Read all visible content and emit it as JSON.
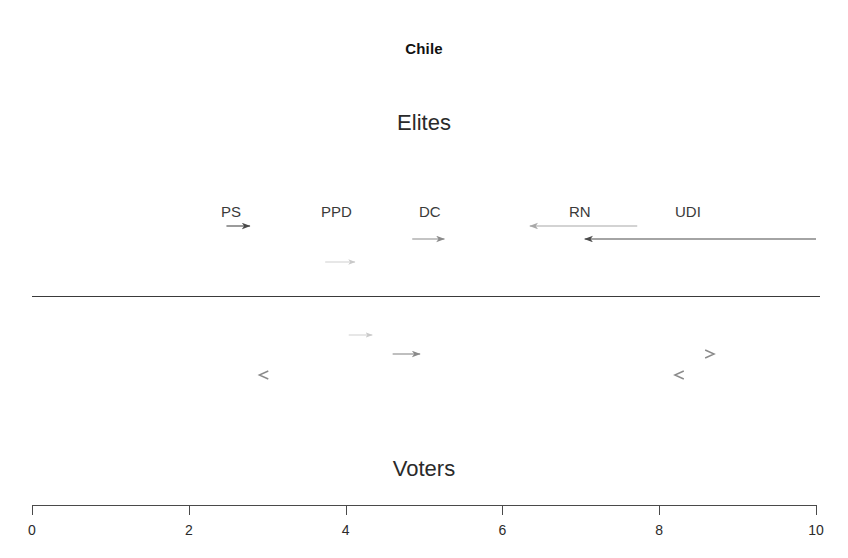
{
  "chart_data": {
    "type": "scatter",
    "title": "Chile",
    "xlabel": "",
    "ylabel": "",
    "xlim": [
      0,
      10
    ],
    "grid": false,
    "legend": null,
    "axis": {
      "ticks": [
        0,
        2,
        4,
        6,
        8,
        10
      ],
      "tick_labels": [
        "0",
        "2",
        "4",
        "6",
        "8",
        "10"
      ],
      "min": 0,
      "max": 10
    },
    "bands": [
      {
        "id": "elites",
        "label": "Elites"
      },
      {
        "id": "voters",
        "label": "Voters"
      }
    ],
    "party_labels": [
      {
        "name": "PS",
        "x": 2.8
      },
      {
        "name": "PPD",
        "x": 4.1
      },
      {
        "name": "DC",
        "x": 5.0
      },
      {
        "name": "RN",
        "x": 7.3
      },
      {
        "name": "UDI",
        "x": 8.6
      }
    ],
    "elite_shifts": [
      {
        "party": "PS",
        "row": 1,
        "from": 2.48,
        "to": 2.78,
        "direction": "right",
        "shade": "dark"
      },
      {
        "party": "RN",
        "row": 1,
        "from": 7.72,
        "to": 6.35,
        "direction": "left",
        "shade": "light"
      },
      {
        "party": "DC",
        "row": 2,
        "from": 4.85,
        "to": 5.26,
        "direction": "right",
        "shade": "medium"
      },
      {
        "party": "UDI",
        "row": 2,
        "from": 10.0,
        "to": 7.05,
        "direction": "left",
        "shade": "dark"
      },
      {
        "party": "PPD",
        "row": 3,
        "from": 3.74,
        "to": 4.12,
        "direction": "right",
        "shade": "faint"
      }
    ],
    "voter_shifts": [
      {
        "party": "PPD",
        "row": 1,
        "from": 4.04,
        "to": 4.34,
        "direction": "right",
        "shade": "faint"
      },
      {
        "party": "DC",
        "row": 2,
        "from": 4.6,
        "to": 4.95,
        "direction": "right",
        "shade": "medium"
      },
      {
        "party": "UDI",
        "row": 2,
        "from": 8.65,
        "to": 8.65,
        "direction": "right",
        "shade": "marker"
      },
      {
        "party": "PS",
        "row": 3,
        "from": 2.95,
        "to": 2.95,
        "direction": "left",
        "shade": "marker"
      },
      {
        "party": "RN",
        "row": 3,
        "from": 8.25,
        "to": 8.25,
        "direction": "left",
        "shade": "marker"
      }
    ]
  },
  "colors": {
    "dark": "#4a4a4a",
    "medium": "#8a8a8a",
    "light": "#a8a8a8",
    "faint": "#c9c9c9",
    "axis": "#4a4a4a",
    "text": "#2a2a2a"
  }
}
